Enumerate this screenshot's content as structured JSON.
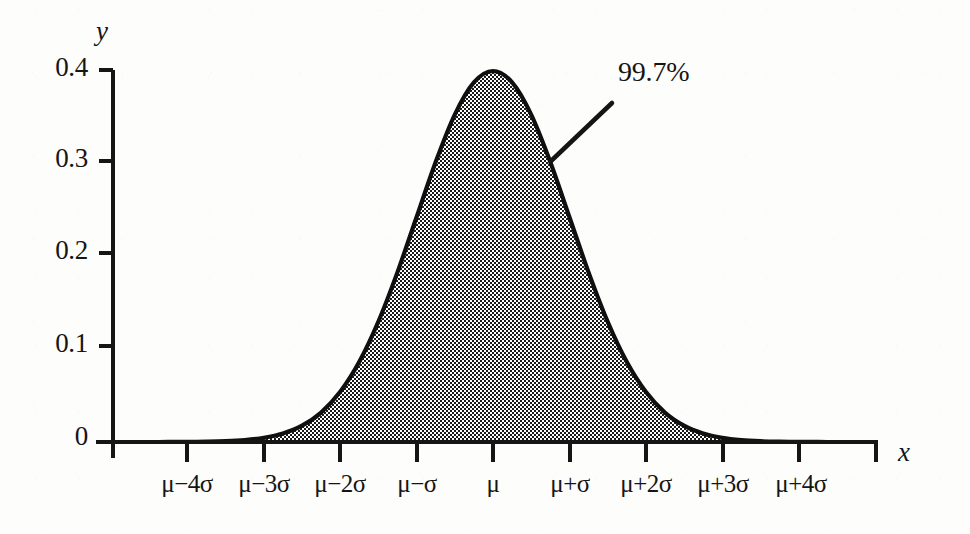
{
  "figure": {
    "kind": "normal-distribution-curve",
    "axis_color": "#151515",
    "fill_appearance": "checkerboard dither (black/white) reading as mid gray",
    "curve_line_color": "#101010"
  },
  "axes": {
    "y_axis_label": "y",
    "x_axis_label": "x",
    "y_ticks": [
      "0.4",
      "0.3",
      "0.2",
      "0.1",
      "0"
    ],
    "x_ticks": [
      "μ−4σ",
      "μ−3σ",
      "μ−2σ",
      "μ−σ",
      "μ",
      "μ+σ",
      "μ+2σ",
      "μ+3σ",
      "μ+4σ"
    ]
  },
  "annotation": {
    "label": "99.7%"
  },
  "chart_data": {
    "type": "area",
    "title": "",
    "xlabel": "x",
    "ylabel": "y",
    "xlim": [
      -5,
      5
    ],
    "ylim": [
      0,
      0.42
    ],
    "ytick_values": [
      0.4,
      0.3,
      0.2,
      0.1,
      0
    ],
    "ytick_labels": [
      "0.4",
      "0.3",
      "0.2",
      "0.1",
      "0"
    ],
    "xtick_values": [
      -4,
      -3,
      -2,
      -1,
      0,
      1,
      2,
      3,
      4
    ],
    "xtick_labels": [
      "μ−4σ",
      "μ−3σ",
      "μ−2σ",
      "μ−σ",
      "μ",
      "μ+σ",
      "μ+2σ",
      "μ+3σ",
      "μ+4σ"
    ],
    "grid": false,
    "legend": false,
    "series": [
      {
        "name": "standard normal density",
        "x": [
          -5,
          -4.75,
          -4.5,
          -4.25,
          -4,
          -3.75,
          -3.5,
          -3.25,
          -3,
          -2.75,
          -2.5,
          -2.25,
          -2,
          -1.75,
          -1.5,
          -1.25,
          -1,
          -0.75,
          -0.5,
          -0.25,
          0,
          0.25,
          0.5,
          0.75,
          1,
          1.25,
          1.5,
          1.75,
          2,
          2.25,
          2.5,
          2.75,
          3,
          3.25,
          3.5,
          3.75,
          4,
          4.25,
          4.5,
          4.75,
          5
        ],
        "y": [
          1.5e-06,
          6.3e-06,
          1.6e-05,
          4.65e-05,
          0.0001338,
          0.0003457,
          0.0008727,
          0.00203,
          0.0044318,
          0.0090936,
          0.0175283,
          0.031658,
          0.053991,
          0.0862773,
          0.1295176,
          0.1826491,
          0.2419707,
          0.3011374,
          0.3520653,
          0.3866681,
          0.3989423,
          0.3866681,
          0.3520653,
          0.3011374,
          0.2419707,
          0.1826491,
          0.1295176,
          0.0862773,
          0.053991,
          0.031658,
          0.0175283,
          0.0090936,
          0.0044318,
          0.00203,
          0.0008727,
          0.0003457,
          0.0001338,
          4.65e-05,
          1.6e-05,
          6.3e-06,
          1.5e-06
        ]
      }
    ],
    "shaded_region": {
      "from": -3,
      "to": 3,
      "label": "99.7%",
      "note": "area under curve within 3 standard deviations of the mean"
    },
    "annotations": [
      {
        "text": "99.7%",
        "points_to_x": 1.05,
        "points_to_y": 0.3
      }
    ]
  }
}
